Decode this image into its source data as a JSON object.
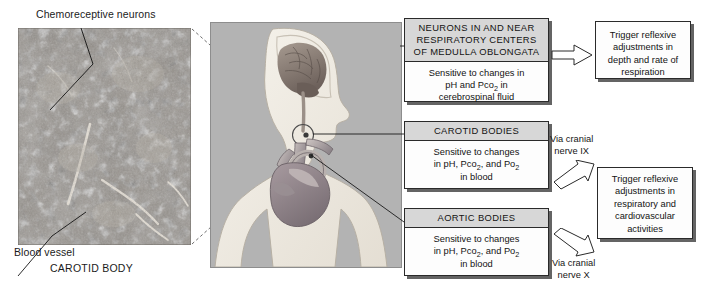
{
  "figure": {
    "micrograph": {
      "top_label": "Chemoreceptive neurons",
      "bottom_label": "Blood vessel",
      "caption": "CAROTID BODY"
    },
    "boxes": [
      {
        "id": "medulla",
        "header": "NEURONS IN AND NEAR RESPIRATORY CENTERS OF MEDULLA OBLONGATA",
        "header_lines": [
          "NEURONS IN AND NEAR",
          "RESPIRATORY CENTERS",
          "OF MEDULLA OBLONGATA"
        ],
        "body_lines": [
          "Sensitive to changes in",
          "pH and Pco₂ in",
          "cerebrospinal fluid"
        ]
      },
      {
        "id": "carotid-bodies",
        "header": "CAROTID BODIES",
        "header_lines": [
          "CAROTID BODIES"
        ],
        "body_lines": [
          "Sensitive to changes",
          "in pH, Pco₂, and Po₂",
          "in blood"
        ]
      },
      {
        "id": "aortic-bodies",
        "header": "AORTIC BODIES",
        "header_lines": [
          "AORTIC BODIES"
        ],
        "body_lines": [
          "Sensitive to changes",
          "in pH, Pco₂, and Po₂",
          "in blood"
        ]
      },
      {
        "id": "respiration-effect",
        "header": "",
        "body_lines": [
          "Trigger reflexive",
          "adjustments in",
          "depth and rate of",
          "respiration"
        ]
      },
      {
        "id": "cardiovascular-effect",
        "header": "",
        "body_lines": [
          "Trigger reflexive",
          "adjustments in",
          "respiratory and",
          "cardiovascular",
          "activities"
        ]
      }
    ],
    "pathways": [
      {
        "id": "nerve-ix",
        "lines": [
          "Via cranial",
          "nerve IX"
        ]
      },
      {
        "id": "nerve-x",
        "lines": [
          "Via cranial",
          "nerve X"
        ]
      }
    ],
    "colors": {
      "panel_background": "#b3b3b3",
      "body_silhouette": "#f0ece4",
      "brain": "#8f8278",
      "heart": "#9a8f92",
      "box_header": "#d7d7d7",
      "box_body": "#fdfdfd",
      "outline": "#2a2a2a",
      "text": "#131313"
    }
  }
}
